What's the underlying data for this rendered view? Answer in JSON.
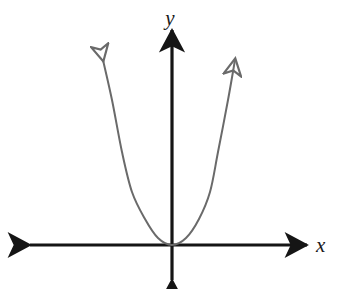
{
  "figure": {
    "background_color": "#ffffff",
    "width": 337,
    "height": 289
  },
  "axes": {
    "x_label": "x",
    "y_label": "y",
    "axis_color": "#151515",
    "axis_stroke_width": 3.2,
    "origin": {
      "x": 172,
      "y": 245
    },
    "x_axis": {
      "name": "x-axis",
      "left_end": 30,
      "right_end": 307,
      "y": 245,
      "arrowheads": "both"
    },
    "y_axis": {
      "name": "y-axis",
      "top_end": 30,
      "bottom_end": 280,
      "x": 172,
      "arrowheads": "both"
    },
    "x_label_pos": {
      "x": 316,
      "y": 252
    },
    "y_label_pos": {
      "x": 163,
      "y": 25
    }
  },
  "chart_data": {
    "type": "line",
    "xlabel": "x",
    "ylabel": "y",
    "grid": false,
    "legend": "none",
    "curve_color": "#6a6a6a",
    "curve_stroke_width": 2,
    "curve_arrowheads": "both",
    "series": [
      {
        "name": "parabola",
        "equation": "y = a x^2",
        "vertex": {
          "x": 0,
          "y": 0
        },
        "opens": "up",
        "symmetry_axis": "x = 0",
        "points_px": [
          {
            "x": 103,
            "y": 60
          },
          {
            "x": 112,
            "y": 100
          },
          {
            "x": 122,
            "y": 152
          },
          {
            "x": 132,
            "y": 192
          },
          {
            "x": 145,
            "y": 219
          },
          {
            "x": 158,
            "y": 238
          },
          {
            "x": 172,
            "y": 245
          },
          {
            "x": 186,
            "y": 238
          },
          {
            "x": 199,
            "y": 219
          },
          {
            "x": 210,
            "y": 192
          },
          {
            "x": 218,
            "y": 152
          },
          {
            "x": 228,
            "y": 100
          },
          {
            "x": 235,
            "y": 60
          }
        ],
        "left_tip_px": {
          "x": 103,
          "y": 60
        },
        "right_tip_px": {
          "x": 235,
          "y": 60
        }
      }
    ]
  }
}
